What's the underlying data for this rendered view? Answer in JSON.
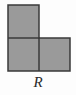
{
  "figure": {
    "label": "R",
    "shape_name": "l-tromino",
    "colors": {
      "fill": "#9a9a9a",
      "stroke": "#3a3a3a",
      "background": "#fdfdfd",
      "label": "#2b2b2b"
    },
    "geometry": {
      "cell_width": 31,
      "cell_height": 33,
      "stroke_width": 1.5,
      "origin_x": 8,
      "origin_y": 5
    },
    "cells": [
      {
        "name": "square-top-left",
        "col": 0,
        "row": 0,
        "x": 8,
        "y": 5,
        "width": 31,
        "height": 33
      },
      {
        "name": "square-bottom-left",
        "col": 0,
        "row": 1,
        "x": 8,
        "y": 38,
        "width": 31,
        "height": 33
      },
      {
        "name": "square-bottom-right",
        "col": 1,
        "row": 1,
        "x": 39,
        "y": 38,
        "width": 31,
        "height": 33
      }
    ],
    "outline_points": "8,5 39,5 39,38 70,38 70,71 8,71",
    "interior_edges": [
      {
        "name": "horizontal-divider",
        "x1": 8,
        "y1": 38,
        "x2": 39,
        "y2": 38
      },
      {
        "name": "vertical-divider",
        "x1": 39,
        "y1": 38,
        "x2": 39,
        "y2": 71
      }
    ]
  }
}
